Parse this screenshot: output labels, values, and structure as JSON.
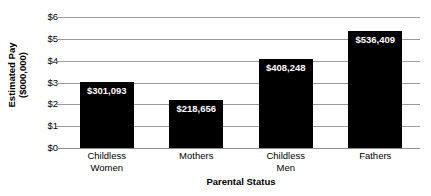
{
  "chart_data": {
    "type": "bar",
    "title": "",
    "xlabel": "Parental Status",
    "ylabel": "Estimated Pay ($000,000)",
    "ylabel_line1": "Estimated Pay",
    "ylabel_line2": "($000,000)",
    "categories": [
      "Childless Women",
      "Mothers",
      "Childless Men",
      "Fathers"
    ],
    "category_lines": [
      [
        "Childless",
        "Women"
      ],
      [
        "Mothers",
        ""
      ],
      [
        "Childless",
        "Men"
      ],
      [
        "Fathers",
        ""
      ]
    ],
    "values": [
      301093,
      218656,
      408248,
      536409
    ],
    "value_labels": [
      "$301,093",
      "$218,656",
      "$408,248",
      "$536,409"
    ],
    "plot_values": [
      3.01093,
      2.18656,
      4.08248,
      5.36409
    ],
    "ylim": [
      0,
      6
    ],
    "ytick_values": [
      0,
      1,
      2,
      3,
      4,
      5,
      6
    ],
    "ytick_labels": [
      "$0",
      "$1",
      "$2",
      "$3",
      "$4",
      "$5",
      "$6"
    ],
    "grid": true,
    "legend": false,
    "bar_color": "#000000",
    "grid_color": "#9a9a9a",
    "label_text_color": "#ffffff",
    "background_color": "#ffffff"
  }
}
